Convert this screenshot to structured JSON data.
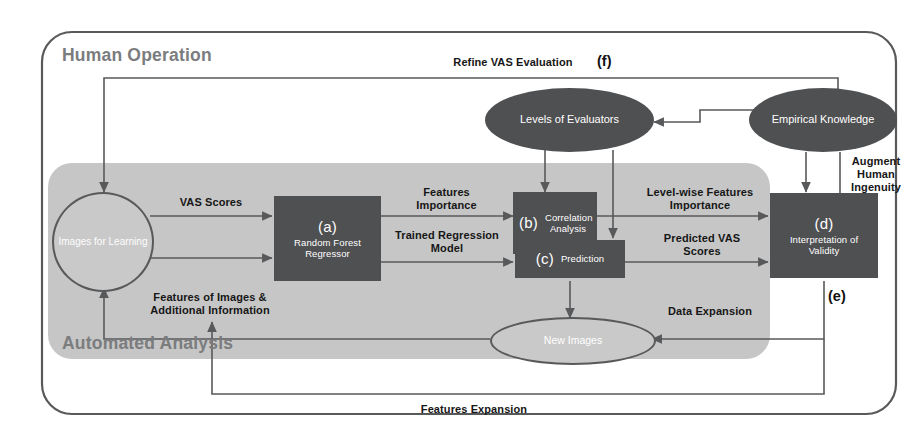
{
  "figure": {
    "zones": [
      {
        "id": "human-operation",
        "label": "Human Operation"
      },
      {
        "id": "automated-analysis",
        "label": "Automated Analysis"
      }
    ],
    "boxes": [
      {
        "id": "a",
        "tag": "(a)",
        "name": "Random Forest Regressor",
        "color": "#4f5052"
      },
      {
        "id": "b",
        "tag": "(b)",
        "name": "Correlation Analysis",
        "color": "#4f5052"
      },
      {
        "id": "c",
        "tag": "(c)",
        "name": "Prediction",
        "color": "#4f5052"
      },
      {
        "id": "d",
        "tag": "(d)",
        "name": "Interpretation of Validity",
        "color": "#4f5052"
      }
    ],
    "ellipses": [
      {
        "id": "images-for-learning",
        "label": "Images for Learning",
        "color": "#c9c9c9"
      },
      {
        "id": "levels-of-evaluators",
        "label": "Levels of Evaluators",
        "color": "#4f5052"
      },
      {
        "id": "empirical-knowledge",
        "label": "Empirical Knowledge",
        "color": "#4f5052"
      },
      {
        "id": "new-images",
        "label": "New Images",
        "color": "#c9c9c9"
      }
    ],
    "edge_labels": [
      {
        "id": "vas-scores",
        "text": "VAS Scores"
      },
      {
        "id": "features-importance",
        "text": "Features Importance"
      },
      {
        "id": "trained-regression-model",
        "text": "Trained Regression Model"
      },
      {
        "id": "level-wise-features-importance",
        "text": "Level-wise Features Importance"
      },
      {
        "id": "predicted-vas-scores",
        "text": "Predicted VAS Scores"
      },
      {
        "id": "features-of-images",
        "text": "Features of Images & Additional Information"
      },
      {
        "id": "refine-vas-evaluation",
        "text": "Refine VAS Evaluation"
      },
      {
        "id": "augment-human-ingenuity",
        "text": "Augment Human Ingenuity"
      },
      {
        "id": "data-expansion",
        "text": "Data Expansion"
      },
      {
        "id": "features-expansion",
        "text": "Features Expansion"
      }
    ],
    "callouts": [
      {
        "id": "f",
        "text": "(f)"
      },
      {
        "id": "e",
        "text": "(e)"
      }
    ],
    "colors": {
      "dark_fill": "#4f5052",
      "light_fill": "#c9c9c9",
      "zone_fill": "#c6c6c6",
      "stroke": "#58595b",
      "text_light": "#ffffff",
      "text_dark": "#161616",
      "zone_text": "#7b7c7e",
      "background": "#ffffff"
    }
  }
}
